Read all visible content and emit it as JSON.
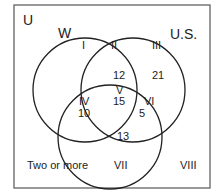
{
  "diagram": {
    "type": "venn",
    "universe_label": "U",
    "sets": [
      {
        "name": "W",
        "label": "W"
      },
      {
        "name": "U.S.",
        "label": "U.S."
      },
      {
        "name": "third",
        "label": ""
      }
    ],
    "regions": {
      "I": {
        "label": "I",
        "value": ""
      },
      "II": {
        "label": "II",
        "value": "12"
      },
      "III": {
        "label": "III",
        "value": "21"
      },
      "IV": {
        "label": "IV",
        "value": "10"
      },
      "V": {
        "label": "V",
        "value": "15"
      },
      "VI": {
        "label": "VI",
        "value": "5"
      },
      "VII": {
        "label": "VII",
        "value": "13"
      },
      "VIII": {
        "label": "VIII",
        "value": ""
      }
    },
    "annotation": "Two or more",
    "colors": {
      "stroke": "#222222",
      "background": "#ffffff",
      "box": "#555555"
    }
  }
}
